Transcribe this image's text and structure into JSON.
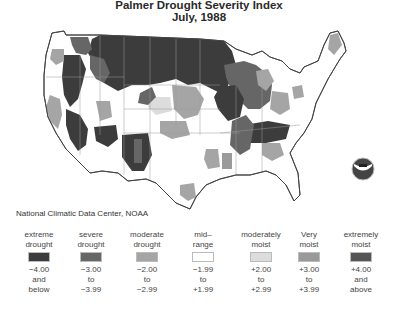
{
  "title": {
    "line1": "Palmer Drought Severity Index",
    "line2": "July, 1988"
  },
  "credit": "National Climatic Data Center, NOAA",
  "logo": "NOAA",
  "colors": {
    "extreme_drought": "#3c3c3c",
    "severe_drought": "#666666",
    "moderate_drought": "#a5a5a5",
    "mid_range": "#ffffff",
    "moderately_moist": "#dcdcdc",
    "very_moist": "#9a9a9a",
    "extremely_moist": "#555555",
    "border": "#8a8a8a"
  },
  "legend": [
    {
      "label1": "extreme",
      "label2": "drought",
      "r1": "−4.00",
      "r2": "and",
      "r3": "below",
      "color": "#3c3c3c"
    },
    {
      "label1": "severe",
      "label2": "drought",
      "r1": "−3.00",
      "r2": "to",
      "r3": "−3.99",
      "color": "#666666"
    },
    {
      "label1": "moderate",
      "label2": "drought",
      "r1": "−2.00",
      "r2": "to",
      "r3": "−2.99",
      "color": "#a5a5a5"
    },
    {
      "label1": "mid–",
      "label2": "range",
      "r1": "−1.99",
      "r2": "to",
      "r3": "+1.99",
      "color": "#ffffff"
    },
    {
      "label1": "moderately",
      "label2": "moist",
      "r1": "+2.00",
      "r2": "to",
      "r3": "+2.99",
      "color": "#dcdcdc"
    },
    {
      "label1": "Very",
      "label2": "moist",
      "r1": "+3.00",
      "r2": "to",
      "r3": "+3.99",
      "color": "#9a9a9a"
    },
    {
      "label1": "extremely",
      "label2": "moist",
      "r1": "+4.00",
      "r2": "and",
      "r3": "above",
      "color": "#555555"
    }
  ]
}
